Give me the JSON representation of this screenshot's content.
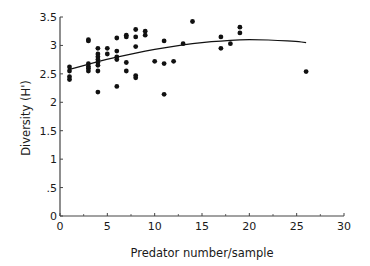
{
  "chart_data": {
    "type": "scatter",
    "title": "",
    "xlabel": "Predator number/sample",
    "ylabel": "Diversity (H')",
    "xlim": [
      0,
      30
    ],
    "ylim": [
      0,
      3.5
    ],
    "xticks": [
      0,
      5,
      10,
      15,
      20,
      25,
      30
    ],
    "xtick_labels": [
      "0",
      "5",
      "10",
      "15",
      "20",
      "25",
      "30"
    ],
    "yticks": [
      0,
      0.5,
      1,
      1.5,
      2,
      2.5,
      3,
      3.5
    ],
    "ytick_labels": [
      "0",
      ".5",
      "1",
      "1.5",
      "2",
      "2.5",
      "3",
      "3.5"
    ],
    "grid": false,
    "legend": null,
    "series": [
      {
        "name": "samples",
        "kind": "points",
        "points": [
          [
            1,
            2.62
          ],
          [
            1,
            2.55
          ],
          [
            1,
            2.45
          ],
          [
            1,
            2.4
          ],
          [
            3,
            3.1
          ],
          [
            3,
            3.08
          ],
          [
            3,
            2.68
          ],
          [
            3,
            2.63
          ],
          [
            3,
            2.6
          ],
          [
            3,
            2.55
          ],
          [
            4,
            2.95
          ],
          [
            4,
            2.85
          ],
          [
            4,
            2.8
          ],
          [
            4,
            2.75
          ],
          [
            4,
            2.7
          ],
          [
            4,
            2.65
          ],
          [
            4,
            2.55
          ],
          [
            4,
            2.18
          ],
          [
            5,
            2.95
          ],
          [
            5,
            2.85
          ],
          [
            6,
            3.13
          ],
          [
            6,
            2.9
          ],
          [
            6,
            2.8
          ],
          [
            6,
            2.75
          ],
          [
            6,
            2.28
          ],
          [
            7,
            3.18
          ],
          [
            7,
            3.15
          ],
          [
            7,
            2.7
          ],
          [
            7,
            2.55
          ],
          [
            8,
            3.28
          ],
          [
            8,
            3.15
          ],
          [
            8,
            2.98
          ],
          [
            8,
            2.47
          ],
          [
            8,
            2.43
          ],
          [
            9,
            3.25
          ],
          [
            9,
            3.18
          ],
          [
            10,
            2.72
          ],
          [
            11,
            3.08
          ],
          [
            11,
            2.68
          ],
          [
            11,
            2.14
          ],
          [
            12,
            2.72
          ],
          [
            13,
            3.03
          ],
          [
            14,
            3.42
          ],
          [
            17,
            3.15
          ],
          [
            17,
            2.95
          ],
          [
            18,
            3.03
          ],
          [
            19,
            3.32
          ],
          [
            19,
            3.22
          ],
          [
            26,
            2.54
          ]
        ]
      },
      {
        "name": "fitted curve",
        "kind": "line",
        "points": [
          [
            1,
            2.58
          ],
          [
            3,
            2.67
          ],
          [
            5,
            2.76
          ],
          [
            7,
            2.83
          ],
          [
            9,
            2.9
          ],
          [
            11,
            2.96
          ],
          [
            13,
            3.01
          ],
          [
            15,
            3.05
          ],
          [
            17,
            3.08
          ],
          [
            19,
            3.1
          ],
          [
            21,
            3.1
          ],
          [
            23,
            3.09
          ],
          [
            25,
            3.07
          ],
          [
            26,
            3.05
          ]
        ]
      }
    ]
  },
  "style": {
    "ink_color": "#111111",
    "axis_color": "#444444",
    "background": "#ffffff"
  }
}
